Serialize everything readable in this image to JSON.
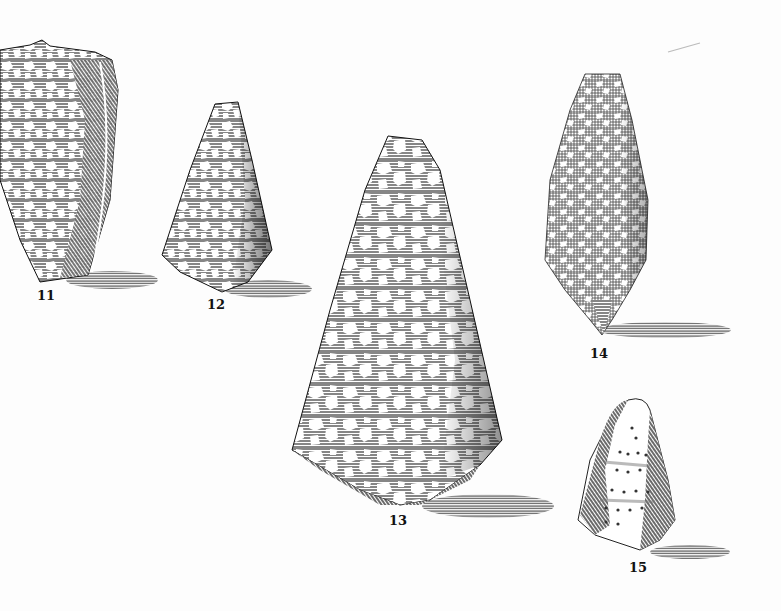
{
  "plate": {
    "background": "#fdfdfd",
    "ink": "#1a1a1a",
    "figures": [
      {
        "number": "11",
        "label_x": 46,
        "label_y": 288
      },
      {
        "number": "12",
        "label_x": 216,
        "label_y": 297
      },
      {
        "number": "13",
        "label_x": 398,
        "label_y": 513
      },
      {
        "number": "14",
        "label_x": 599,
        "label_y": 346
      },
      {
        "number": "15",
        "label_x": 638,
        "label_y": 560
      }
    ]
  }
}
